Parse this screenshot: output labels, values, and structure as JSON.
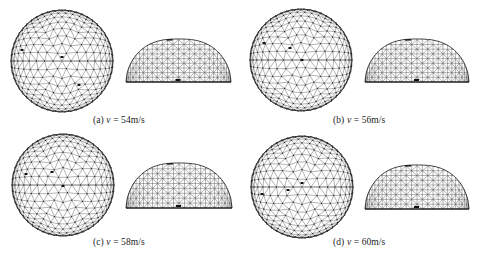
{
  "figure": {
    "panels": [
      {
        "id": "a",
        "label": "(a)",
        "variable": "v",
        "equals": "=",
        "value": "54m/s",
        "top_view": {
          "cx": 62,
          "cy": 61,
          "r": 51
        },
        "side_view": {
          "x0": 126,
          "x1": 231,
          "top": 39,
          "base": 82
        },
        "caption_pos": {
          "x": 93,
          "y": 115
        },
        "marks": [
          [
            22,
            50
          ],
          [
            62,
            57
          ],
          [
            79,
            85
          ]
        ]
      },
      {
        "id": "b",
        "label": "(b)",
        "variable": "v",
        "equals": "=",
        "value": "56m/s",
        "top_view": {
          "cx": 301,
          "cy": 60,
          "r": 51
        },
        "side_view": {
          "x0": 365,
          "x1": 469,
          "top": 39,
          "base": 82
        },
        "caption_pos": {
          "x": 333,
          "y": 115
        },
        "marks": [
          [
            264,
            43
          ],
          [
            290,
            48
          ],
          [
            302,
            60
          ]
        ]
      },
      {
        "id": "c",
        "label": "(c)",
        "variable": "v",
        "equals": "=",
        "value": "58m/s",
        "top_view": {
          "cx": 63,
          "cy": 185,
          "r": 51
        },
        "side_view": {
          "x0": 126,
          "x1": 232,
          "top": 163,
          "base": 208
        },
        "caption_pos": {
          "x": 93,
          "y": 237
        },
        "marks": [
          [
            26,
            174
          ],
          [
            52,
            172
          ],
          [
            63,
            186
          ]
        ]
      },
      {
        "id": "d",
        "label": "(d)",
        "variable": "v",
        "equals": "=",
        "value": "60m/s",
        "top_view": {
          "cx": 302,
          "cy": 187,
          "r": 51
        },
        "side_view": {
          "x0": 365,
          "x1": 469,
          "top": 165,
          "base": 209
        },
        "caption_pos": {
          "x": 333,
          "y": 237
        },
        "marks": [
          [
            262,
            194
          ],
          [
            288,
            190
          ],
          [
            302,
            183
          ]
        ]
      }
    ],
    "colors": {
      "line": "#555555",
      "node": "#222222",
      "background": "#ffffff",
      "text": "#222222"
    }
  }
}
